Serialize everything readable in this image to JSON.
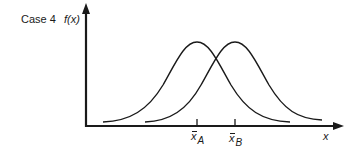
{
  "figure": {
    "case_label": "Case 4",
    "y_axis_label": "f(x)",
    "x_axis_label": "x",
    "colors": {
      "stroke": "#1a1a1a",
      "background": "#ffffff"
    }
  },
  "means": [
    {
      "symbol": "x",
      "subscript": "A",
      "tick_x": 197
    },
    {
      "symbol": "x",
      "subscript": "B",
      "tick_x": 235
    }
  ],
  "curves": [
    {
      "name": "distribution-A",
      "peak_x": 197,
      "description": "normal curve centered at x̄A"
    },
    {
      "name": "distribution-B",
      "peak_x": 235,
      "description": "normal curve centered at x̄B"
    }
  ]
}
